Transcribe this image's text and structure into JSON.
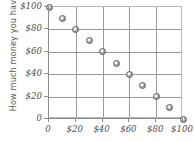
{
  "chart_data": {
    "type": "scatter",
    "title": "",
    "xlabel": "",
    "ylabel": "How much money you have",
    "xlim": [
      0,
      100
    ],
    "ylim": [
      0,
      100
    ],
    "grid": true,
    "legend": "none",
    "x_tick_labels": [
      "0",
      "$20",
      "$40",
      "$60",
      "$80",
      "$100"
    ],
    "x_tick_values": [
      0,
      20,
      40,
      60,
      80,
      100
    ],
    "y_tick_labels": [
      "0",
      "$20",
      "$40",
      "$60",
      "$80",
      "$100"
    ],
    "y_tick_values": [
      0,
      20,
      40,
      60,
      80,
      100
    ],
    "x": [
      0,
      10,
      20,
      30,
      40,
      50,
      60,
      70,
      80,
      90,
      100
    ],
    "y": [
      100,
      90,
      80,
      70,
      60,
      50,
      40,
      30,
      20,
      10,
      0
    ],
    "points": [
      {
        "x": 0,
        "y": 100
      },
      {
        "x": 10,
        "y": 90
      },
      {
        "x": 20,
        "y": 80
      },
      {
        "x": 30,
        "y": 70
      },
      {
        "x": 40,
        "y": 60
      },
      {
        "x": 50,
        "y": 50
      },
      {
        "x": 60,
        "y": 40
      },
      {
        "x": 70,
        "y": 30
      },
      {
        "x": 80,
        "y": 20
      },
      {
        "x": 90,
        "y": 10
      },
      {
        "x": 100,
        "y": 0
      }
    ],
    "annotations": [],
    "colors": {
      "marker_fill": "#9f9f9f",
      "marker_edge": "#5d5d5d",
      "gridline": "#9a9a9a",
      "axis": "#8d8d8d",
      "text": "#4c4c4c",
      "axis_title": "#5a5a5a",
      "background": "#ffffff"
    }
  }
}
